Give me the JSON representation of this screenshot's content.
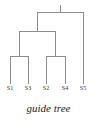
{
  "figure": {
    "caption": "guide tree",
    "background_color": "#ffffff",
    "line_color": "#8c8c8c",
    "label_color": "#2e2e2e",
    "width": 97,
    "height": 128
  },
  "chart_data": {
    "type": "dendrogram",
    "title": "guide tree",
    "orientation": "top-down",
    "leaves": [
      {
        "label": "S1",
        "x": 10,
        "y": 84
      },
      {
        "label": "S3",
        "x": 28,
        "y": 84
      },
      {
        "label": "S2",
        "x": 46,
        "y": 84
      },
      {
        "label": "S4",
        "x": 65,
        "y": 84
      },
      {
        "label": "S5",
        "x": 83,
        "y": 84
      }
    ],
    "nodes": [
      {
        "id": "n1",
        "children": [
          "S1",
          "S3"
        ],
        "x": 19,
        "y": 56
      },
      {
        "id": "n2",
        "children": [
          "S2",
          "S4"
        ],
        "x": 55,
        "y": 56
      },
      {
        "id": "n3",
        "children": [
          "n1",
          "n2"
        ],
        "x": 37,
        "y": 31
      },
      {
        "id": "root",
        "children": [
          "n3",
          "S5"
        ],
        "x": 60,
        "y": 12
      }
    ],
    "root_stub": {
      "x": 60,
      "y_top": 5,
      "y_bottom": 12
    },
    "grid": false,
    "legend": null,
    "xlabel": "",
    "ylabel": ""
  },
  "leaf_labels": {
    "items": [
      {
        "text": "S1"
      },
      {
        "text": "S3"
      },
      {
        "text": "S2"
      },
      {
        "text": "S4"
      },
      {
        "text": "S5"
      }
    ]
  }
}
